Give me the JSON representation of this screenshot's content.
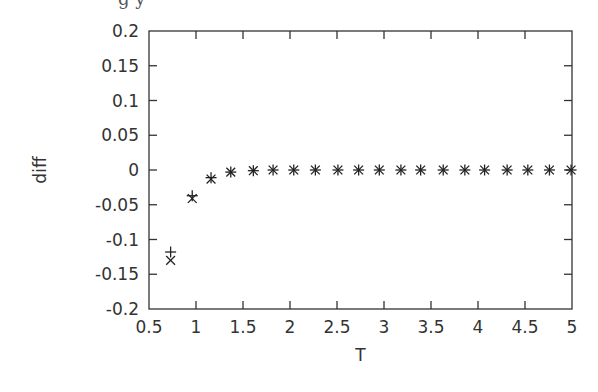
{
  "chart_data": {
    "type": "scatter",
    "title": "",
    "xlabel": "T",
    "ylabel": "diff",
    "xlim": [
      0.5,
      5
    ],
    "ylim": [
      -0.2,
      0.2
    ],
    "xticks": [
      0.5,
      1,
      1.5,
      2,
      2.5,
      3,
      3.5,
      4,
      4.5,
      5
    ],
    "xtick_labels": [
      "0.5",
      "1",
      "1.5",
      "2",
      "2.5",
      "3",
      "3.5",
      "4",
      "4.5",
      "5"
    ],
    "yticks": [
      -0.2,
      -0.15,
      -0.1,
      -0.05,
      0,
      0.05,
      0.1,
      0.15,
      0.2
    ],
    "ytick_labels": [
      "-0.2",
      "-0.15",
      "-0.1",
      "-0.05",
      "0",
      "0.05",
      "0.1",
      "0.15",
      "0.2"
    ],
    "grid": false,
    "legend": "none",
    "x": [
      0.73,
      0.96,
      1.16,
      1.37,
      1.61,
      1.82,
      2.04,
      2.27,
      2.51,
      2.73,
      2.95,
      3.18,
      3.39,
      3.63,
      3.86,
      4.07,
      4.31,
      4.53,
      4.76,
      4.99
    ],
    "series": [
      {
        "name": "series-plus",
        "marker": "+",
        "values": [
          -0.118,
          -0.037,
          -0.011,
          -0.003,
          -0.001,
          0,
          0,
          0,
          0,
          0,
          0,
          0,
          0,
          0,
          0,
          0,
          0,
          0,
          0,
          0
        ]
      },
      {
        "name": "series-cross",
        "marker": "x",
        "values": [
          -0.13,
          -0.041,
          -0.013,
          -0.003,
          -0.001,
          0,
          0,
          0,
          0,
          0,
          0,
          0,
          0,
          0,
          0,
          0,
          0,
          0,
          0,
          0
        ]
      }
    ]
  },
  "style": {
    "axis_color": "#333333",
    "marker_color": "#222222",
    "background": "#ffffff"
  },
  "layout": {
    "plot_left": 149,
    "plot_right": 572,
    "plot_top": 31,
    "plot_bottom": 309
  },
  "top_cut_text": "g y"
}
